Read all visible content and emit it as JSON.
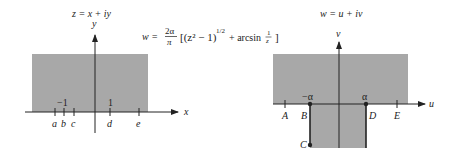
{
  "left_plane": {
    "title": "z = x + iy",
    "x_axis_label": "x",
    "y_axis_label": "y",
    "tick_values": [
      "−1",
      "1"
    ],
    "point_labels": [
      "a",
      "b",
      "c",
      "d",
      "e"
    ],
    "shade_color": "#a8a8a8"
  },
  "right_plane": {
    "title": "w = u + iv",
    "u_axis_label": "u",
    "v_axis_label": "v",
    "tick_values": [
      "−α",
      "α"
    ],
    "point_labels": [
      "A",
      "B",
      "C",
      "D",
      "E"
    ],
    "shade_color": "#a8a8a8"
  },
  "formula": {
    "lhs": "w =",
    "frac_num": "2α",
    "frac_den": "π",
    "body": "[(z² − 1)",
    "exponent": "1/2",
    "tail": "+ arcsin",
    "frac2_num": "1",
    "frac2_den": "z",
    "close": "]"
  }
}
